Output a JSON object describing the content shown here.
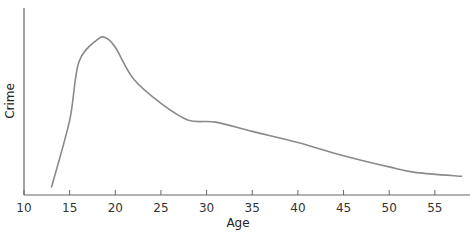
{
  "chart_data": {
    "type": "line",
    "title": "",
    "xlabel": "Age",
    "ylabel": "Crime",
    "xlim": [
      10,
      59
    ],
    "ylim": [
      0,
      100
    ],
    "x_ticks": [
      10,
      15,
      20,
      25,
      30,
      35,
      40,
      45,
      50,
      55
    ],
    "y_ticks": [],
    "grid": false,
    "legend": null,
    "line_color": "#8a8a8a",
    "axis_color": "#666666",
    "series": [
      {
        "name": "Crime by age",
        "x": [
          13,
          15,
          16,
          18,
          19,
          20,
          22,
          25,
          28,
          31,
          35,
          40,
          45,
          50,
          53,
          58
        ],
        "values": [
          4,
          40,
          71,
          83,
          84,
          79,
          62,
          49,
          40,
          39,
          34,
          28,
          21,
          15,
          12,
          10
        ]
      }
    ]
  }
}
